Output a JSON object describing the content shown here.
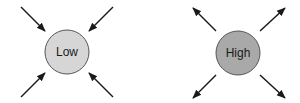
{
  "diagram": {
    "nodes": [
      {
        "id": "low",
        "label": "Low",
        "fill": "#d6d6d6",
        "stroke": "#555555",
        "cx": 67,
        "cy": 52,
        "r": 22,
        "arrow_direction": "inward"
      },
      {
        "id": "high",
        "label": "High",
        "fill": "#a9a9a9",
        "stroke": "#555555",
        "cx": 238,
        "cy": 53,
        "r": 22,
        "arrow_direction": "outward"
      }
    ],
    "arrow_color": "#1a1a1a"
  }
}
